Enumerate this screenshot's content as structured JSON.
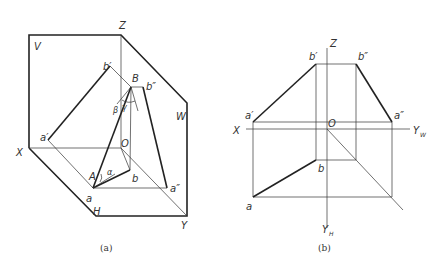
{
  "figure_a": {
    "caption": "(a)",
    "planes": {
      "v": "V",
      "w": "W",
      "h": "H"
    },
    "axes": {
      "x": "X",
      "y": "Y",
      "z": "Z",
      "origin": "O"
    },
    "points": {
      "a_prime": "a′",
      "b_prime": "b′",
      "a_dprime": "a″",
      "b_dprime": "b″",
      "a": "a",
      "b": "b",
      "A": "A",
      "B": "B"
    },
    "angles": {
      "alpha": "α",
      "beta": "β",
      "gamma": "γ"
    }
  },
  "figure_b": {
    "caption": "(b)",
    "axes": {
      "x": "X",
      "z": "Z",
      "yw": "Y",
      "yw_sub": "W",
      "yh": "Y",
      "yh_sub": "H",
      "origin": "O"
    },
    "points": {
      "a_prime": "a′",
      "b_prime": "b′",
      "a_dprime": "a″",
      "b_dprime": "b″",
      "a": "a",
      "b": "b"
    }
  }
}
